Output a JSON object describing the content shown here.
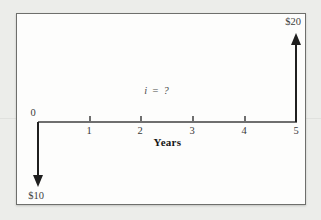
{
  "figure": {
    "origin_tick": "0",
    "year_ticks": [
      "1",
      "2",
      "3",
      "4",
      "5"
    ],
    "axis_title": "Years",
    "rate_annotation": "i = ?",
    "inflow": {
      "label": "$20",
      "year": 5,
      "amount": 20
    },
    "outflow": {
      "label": "$10",
      "year": 0,
      "amount": -10
    }
  },
  "colors": {
    "page_background": "#ecedea",
    "panel_background": "#fdfdfc",
    "panel_border": "#6e6f6c",
    "axis_line": "#6f6f6f",
    "arrow": "#1f1f1f",
    "text": "#3a3a3a"
  },
  "chart_data": {
    "type": "bar",
    "subtype": "cash-flow-diagram",
    "title": "",
    "xlabel": "Years",
    "ylabel": "",
    "x_ticks": [
      0,
      1,
      2,
      3,
      4,
      5
    ],
    "xlim": [
      0,
      5
    ],
    "cash_flows": [
      {
        "year": 0,
        "value": -10,
        "label": "$10",
        "direction": "down"
      },
      {
        "year": 5,
        "value": 20,
        "label": "$20",
        "direction": "up"
      }
    ],
    "annotations": [
      "i = ?"
    ],
    "grid": false,
    "legend": false
  }
}
